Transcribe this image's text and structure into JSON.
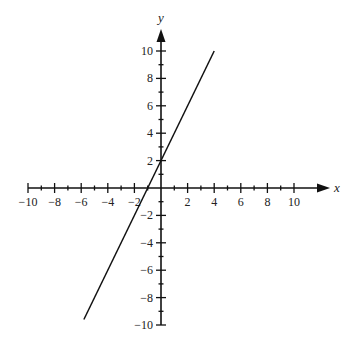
{
  "chart_data": {
    "type": "line",
    "title": "",
    "xlabel": "x",
    "ylabel": "y",
    "xlim": [
      -10,
      10
    ],
    "ylim": [
      -10,
      10
    ],
    "grid": false,
    "x_ticks": [
      -10,
      -8,
      -6,
      -4,
      -2,
      2,
      4,
      6,
      8,
      10
    ],
    "y_ticks": [
      -10,
      -8,
      -6,
      -4,
      -2,
      2,
      4,
      6,
      8,
      10
    ],
    "x_tick_labels": [
      "−10",
      "−8",
      "−6",
      "−4",
      "−2",
      "2",
      "4",
      "6",
      "8",
      "10"
    ],
    "y_tick_labels": [
      "−10",
      "−8",
      "−6",
      "−4",
      "−2",
      "2",
      "4",
      "6",
      "8",
      "10"
    ],
    "series": [
      {
        "name": "y = 2x + 2",
        "equation": "y = 2x + 2",
        "x": [
          -5.8,
          4
        ],
        "y": [
          -9.6,
          10
        ],
        "color": "#111111"
      }
    ]
  }
}
